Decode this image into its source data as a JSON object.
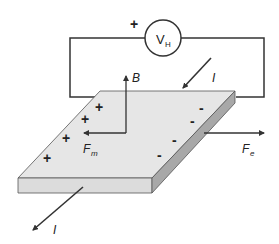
{
  "diagram": {
    "voltmeter": {
      "label_main": "V",
      "label_sub": "H",
      "polarity_sign": "+"
    },
    "labels": {
      "magnetic_field": "B",
      "magnetic_force_main": "F",
      "magnetic_force_sub": "m",
      "electric_force_main": "F",
      "electric_force_sub": "e",
      "current_in": "I",
      "current_out": "I"
    },
    "charges": {
      "positive": [
        "+",
        "+",
        "+",
        "+"
      ],
      "negative": [
        "-",
        "-",
        "-",
        "-"
      ]
    },
    "colors": {
      "slab_top": "#e6e6e6",
      "slab_front": "#dcdcdc",
      "slab_side": "#a8a8a8",
      "lines": "#333333"
    }
  }
}
